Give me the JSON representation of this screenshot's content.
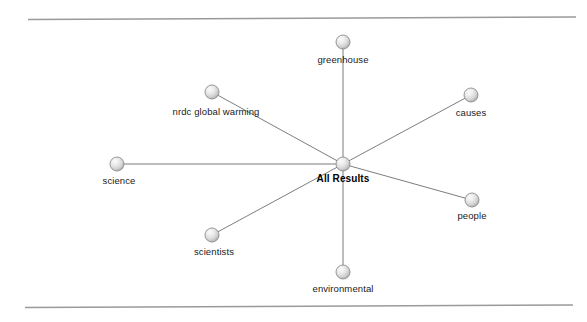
{
  "canvas": {
    "width": 587,
    "height": 322,
    "background": "#ffffff"
  },
  "rules": {
    "top": {
      "x1": 28,
      "y1": 19.5,
      "x2": 576,
      "y2": 17.0,
      "color": "#9a9a9a"
    },
    "bottom": {
      "x1": 25,
      "y1": 307.5,
      "x2": 573,
      "y2": 305.0,
      "color": "#9a9a9a"
    }
  },
  "graph": {
    "type": "radial-node-link",
    "edge_color": "#6e6e6e",
    "node_fill_light": "#f2f2f2",
    "node_fill_mid": "#d4d4d4",
    "node_fill_dark": "#a9a9a9",
    "node_stroke": "#8c8c8c",
    "node_radius": 7,
    "center": {
      "id": "all-results",
      "label": "All Results",
      "x": 343,
      "y": 164,
      "label_x": 343,
      "label_y": 173,
      "bold": true
    },
    "nodes": [
      {
        "id": "greenhouse",
        "label": "greenhouse",
        "x": 343,
        "y": 42,
        "label_x": 343,
        "label_y": 54
      },
      {
        "id": "causes",
        "label": "causes",
        "x": 471,
        "y": 95,
        "label_x": 471,
        "label_y": 107
      },
      {
        "id": "people",
        "label": "people",
        "x": 472,
        "y": 200,
        "label_x": 472,
        "label_y": 210
      },
      {
        "id": "environmental",
        "label": "environmental",
        "x": 343,
        "y": 272,
        "label_x": 343,
        "label_y": 283
      },
      {
        "id": "scientists",
        "label": "scientists",
        "x": 212,
        "y": 235,
        "label_x": 214,
        "label_y": 246
      },
      {
        "id": "science",
        "label": "science",
        "x": 117,
        "y": 164,
        "label_x": 119,
        "label_y": 175
      },
      {
        "id": "nrdc-global-warming",
        "label": "nrdc global warming",
        "x": 212,
        "y": 92,
        "label_x": 216,
        "label_y": 106
      }
    ],
    "edges": [
      {
        "from": "all-results",
        "to": "greenhouse"
      },
      {
        "from": "all-results",
        "to": "causes"
      },
      {
        "from": "all-results",
        "to": "people"
      },
      {
        "from": "all-results",
        "to": "environmental"
      },
      {
        "from": "all-results",
        "to": "scientists"
      },
      {
        "from": "all-results",
        "to": "science"
      },
      {
        "from": "all-results",
        "to": "nrdc-global-warming"
      }
    ]
  }
}
